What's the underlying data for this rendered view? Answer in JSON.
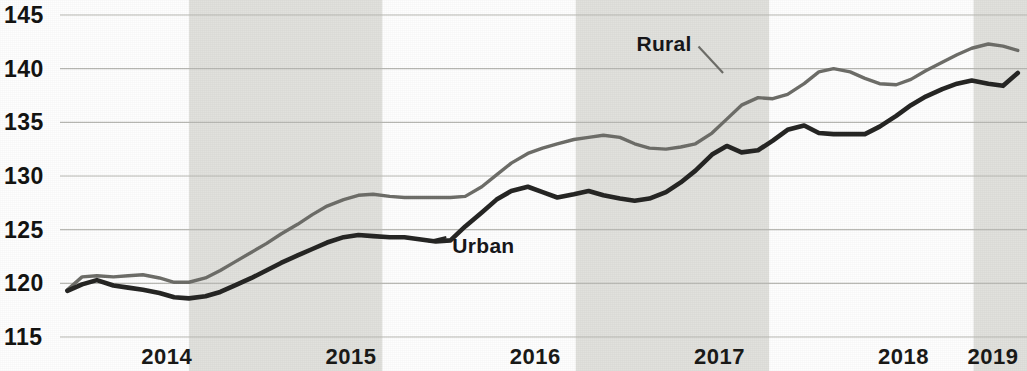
{
  "chart_data": {
    "type": "line",
    "title": "",
    "subtitle": "",
    "xlabel": "",
    "ylabel": "",
    "ylim": [
      115,
      145
    ],
    "xlim": [
      2013.92,
      2019.17
    ],
    "grid": true,
    "gridlines_y": [
      115,
      120,
      125,
      130,
      135,
      140,
      145
    ],
    "y_tick_labels": [
      "145",
      "140",
      "135",
      "130",
      "125",
      "120",
      "115"
    ],
    "x_tick_labels": [
      "2014",
      "2015",
      "2016",
      "2017",
      "2018",
      "2019"
    ],
    "x_tick_values": [
      2014,
      2015,
      2016,
      2017,
      2018,
      2019
    ],
    "legend_position": "inline-annotation",
    "shaded_bands": [
      {
        "from": 2014.62,
        "to": 2015.67
      },
      {
        "from": 2016.72,
        "to": 2017.77
      },
      {
        "from": 2018.88,
        "to": 2019.17
      }
    ],
    "series": [
      {
        "name": "Rural",
        "color": "#6e6e69",
        "label_x": 2017.05,
        "label_y": 141.6,
        "x": [
          2013.96,
          2014.04,
          2014.12,
          2014.21,
          2014.29,
          2014.37,
          2014.46,
          2014.54,
          2014.62,
          2014.71,
          2014.79,
          2014.87,
          2014.96,
          2015.04,
          2015.12,
          2015.21,
          2015.29,
          2015.37,
          2015.46,
          2015.54,
          2015.62,
          2015.71,
          2015.79,
          2015.87,
          2015.96,
          2016.04,
          2016.12,
          2016.21,
          2016.29,
          2016.37,
          2016.46,
          2016.54,
          2016.62,
          2016.71,
          2016.79,
          2016.87,
          2016.96,
          2017.04,
          2017.12,
          2017.21,
          2017.29,
          2017.37,
          2017.46,
          2017.54,
          2017.62,
          2017.71,
          2017.79,
          2017.87,
          2017.96,
          2018.04,
          2018.12,
          2018.21,
          2018.29,
          2018.37,
          2018.46,
          2018.54,
          2018.62,
          2018.71,
          2018.79,
          2018.87,
          2018.96,
          2019.04,
          2019.12
        ],
        "y": [
          119.4,
          120.6,
          120.7,
          120.6,
          120.7,
          120.8,
          120.5,
          120.1,
          120.1,
          120.5,
          121.2,
          122.0,
          122.9,
          123.7,
          124.6,
          125.5,
          126.4,
          127.2,
          127.8,
          128.2,
          128.3,
          128.1,
          128.0,
          128.0,
          128.0,
          128.0,
          128.1,
          129.0,
          130.1,
          131.2,
          132.1,
          132.6,
          133.0,
          133.4,
          133.6,
          133.8,
          133.6,
          133.0,
          132.6,
          132.5,
          132.7,
          133.0,
          134.0,
          135.3,
          136.6,
          137.3,
          137.2,
          137.6,
          138.6,
          139.7,
          140.0,
          139.7,
          139.1,
          138.6,
          138.5,
          139.0,
          139.8,
          140.6,
          141.3,
          141.9,
          142.3,
          142.1,
          141.7
        ]
      },
      {
        "name": "Urban",
        "color": "#262624",
        "label_x": 2016.05,
        "label_y": 122.8,
        "x": [
          2013.96,
          2014.04,
          2014.12,
          2014.21,
          2014.29,
          2014.37,
          2014.46,
          2014.54,
          2014.62,
          2014.71,
          2014.79,
          2014.87,
          2014.96,
          2015.04,
          2015.12,
          2015.21,
          2015.29,
          2015.37,
          2015.46,
          2015.54,
          2015.62,
          2015.71,
          2015.79,
          2015.87,
          2015.96,
          2016.04,
          2016.12,
          2016.21,
          2016.29,
          2016.37,
          2016.46,
          2016.54,
          2016.62,
          2016.71,
          2016.79,
          2016.87,
          2016.96,
          2017.04,
          2017.12,
          2017.21,
          2017.29,
          2017.37,
          2017.46,
          2017.54,
          2017.62,
          2017.71,
          2017.79,
          2017.87,
          2017.96,
          2018.04,
          2018.12,
          2018.21,
          2018.29,
          2018.37,
          2018.46,
          2018.54,
          2018.62,
          2018.71,
          2018.79,
          2018.87,
          2018.96,
          2019.04,
          2019.12
        ],
        "y": [
          119.3,
          119.9,
          120.3,
          119.8,
          119.6,
          119.4,
          119.1,
          118.7,
          118.6,
          118.8,
          119.2,
          119.8,
          120.5,
          121.2,
          121.9,
          122.6,
          123.2,
          123.8,
          124.3,
          124.5,
          124.4,
          124.3,
          124.3,
          124.1,
          123.9,
          124.0,
          125.3,
          126.6,
          127.8,
          128.6,
          129.0,
          128.5,
          128.0,
          128.3,
          128.6,
          128.2,
          127.9,
          127.7,
          127.9,
          128.5,
          129.4,
          130.5,
          132.0,
          132.8,
          132.2,
          132.4,
          133.3,
          134.3,
          134.7,
          134.0,
          133.9,
          133.9,
          133.9,
          134.6,
          135.6,
          136.6,
          137.4,
          138.1,
          138.6,
          138.9,
          138.6,
          138.4,
          139.6
        ]
      }
    ]
  },
  "series_labels": {
    "rural": "Rural",
    "urban": "Urban"
  }
}
